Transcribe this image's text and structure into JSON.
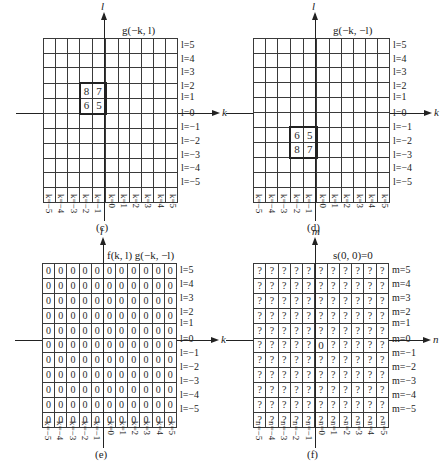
{
  "figure": {
    "panels": [
      {
        "id": "c",
        "caption": "(c)",
        "title": "g(−k, l)",
        "v_axis_label": "l",
        "h_axis_label": "k",
        "row_var": "l",
        "col_var": "k",
        "row_labels": [
          "l=5",
          "l=4",
          "l=3",
          "l=2",
          "l=1",
          "l=0",
          "l=−1",
          "l=−2",
          "l=−3",
          "l=−4",
          "l=−5"
        ],
        "col_labels": [
          "k=−5",
          "k=−4",
          "k=−3",
          "k=−2",
          "k=−1",
          "k=0",
          "k=1",
          "k=2",
          "k=3",
          "k=4",
          "k=5"
        ],
        "grid": {
          "left": 43,
          "top": 38,
          "width": 135,
          "height": 151
        },
        "cells": [
          {
            "row": 3,
            "col": 3,
            "value": "8"
          },
          {
            "row": 3,
            "col": 4,
            "value": "7"
          },
          {
            "row": 4,
            "col": 3,
            "value": "6"
          },
          {
            "row": 4,
            "col": 4,
            "value": "5"
          }
        ],
        "kernel_box": {
          "row_start": 3,
          "row_end": 4,
          "col_start": 3,
          "col_end": 4
        },
        "fill": ""
      },
      {
        "id": "d",
        "caption": "(d)",
        "title": "g(−k, −l)",
        "v_axis_label": "l",
        "h_axis_label": "k",
        "row_var": "l",
        "col_var": "k",
        "row_labels": [
          "l=5",
          "l=4",
          "l=3",
          "l=2",
          "l=1",
          "l=0",
          "l=−1",
          "l=−2",
          "l=−3",
          "l=−4",
          "l=−5"
        ],
        "col_labels": [
          "k=−5",
          "k=−4",
          "k=−3",
          "k=−2",
          "k=−1",
          "k=0",
          "k=1",
          "k=2",
          "k=3",
          "k=4",
          "k=5"
        ],
        "grid": {
          "left": 253,
          "top": 38,
          "width": 137,
          "height": 151
        },
        "cells": [
          {
            "row": 6,
            "col": 3,
            "value": "6"
          },
          {
            "row": 6,
            "col": 4,
            "value": "5"
          },
          {
            "row": 7,
            "col": 3,
            "value": "8"
          },
          {
            "row": 7,
            "col": 4,
            "value": "7"
          }
        ],
        "kernel_box": {
          "row_start": 6,
          "row_end": 7,
          "col_start": 3,
          "col_end": 4
        },
        "fill": ""
      },
      {
        "id": "e",
        "caption": "(e)",
        "title": "f(k, l) g(−k, −l)",
        "v_axis_label": "l",
        "h_axis_label": "k",
        "row_var": "l",
        "col_var": "k",
        "row_labels": [
          "l=5",
          "l=4",
          "l=3",
          "l=2",
          "l=1",
          "l=0",
          "l=−1",
          "l=−2",
          "l=−3",
          "l=−4",
          "l=−5"
        ],
        "col_labels": [
          "k=−5",
          "k=−4",
          "k=−3",
          "k=−2",
          "k=−1",
          "k=0",
          "k=1",
          "k=2",
          "k=3",
          "k=4",
          "k=5"
        ],
        "grid": {
          "left": 42,
          "top": 263,
          "width": 135,
          "height": 153
        },
        "cells": [],
        "kernel_box": null,
        "fill": "0"
      },
      {
        "id": "f",
        "caption": "(f)",
        "title": "s(0, 0)=0",
        "v_axis_label": "m",
        "h_axis_label": "n",
        "row_var": "m",
        "col_var": "n",
        "row_labels": [
          "m=5",
          "m=4",
          "m=3",
          "m=2",
          "m=1",
          "m=0",
          "m=−1",
          "m=−2",
          "m=−3",
          "m=−4",
          "m=−5"
        ],
        "col_labels": [
          "n=−5",
          "n=−4",
          "n=−3",
          "n=−2",
          "n=−1",
          "n=0",
          "n=1",
          "n=2",
          "n=3",
          "n=4",
          "n=5"
        ],
        "grid": {
          "left": 253,
          "top": 263,
          "width": 136,
          "height": 153
        },
        "cells": [
          {
            "row": 5,
            "col": 5,
            "value": "0"
          }
        ],
        "kernel_box": null,
        "fill": "?"
      }
    ]
  }
}
